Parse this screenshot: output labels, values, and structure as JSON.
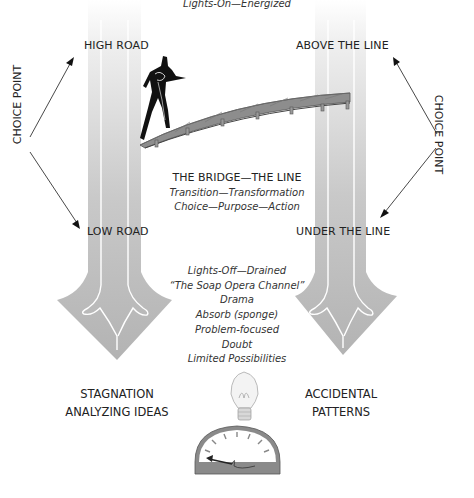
{
  "top_caption": "Lights-On—Energized",
  "left": {
    "top_label": "HIGH ROAD",
    "bottom_label": "LOW ROAD",
    "choice_point": "CHOICE POINT",
    "outcome": [
      "STAGNATION",
      "ANALYZING IDEAS"
    ]
  },
  "right": {
    "top_label": "ABOVE THE LINE",
    "bottom_label": "UNDER THE LINE",
    "choice_point": "CHOICE POINT",
    "outcome": [
      "ACCIDENTAL",
      "PATTERNS"
    ]
  },
  "bridge": {
    "title": "THE BRIDGE—THE LINE",
    "lines": [
      "Transition—Transformation",
      "Choice—Purpose—Action"
    ]
  },
  "lights_off": {
    "lines": [
      "Lights-Off—Drained",
      "“The Soap Opera Channel”",
      "Drama",
      "Absorb (sponge)",
      "Problem-focused",
      "Doubt",
      "Limited Possibilities"
    ]
  },
  "icons": [
    "person-figure-icon",
    "bridge-icon",
    "down-arrow-icon",
    "lightbulb-icon",
    "gauge-icon"
  ],
  "colors": {
    "arrow_gray": "#b4b4b4",
    "arrow_light": "#e6e6e6",
    "bridge_gray": "#8a8a8a",
    "text": "#222222"
  }
}
